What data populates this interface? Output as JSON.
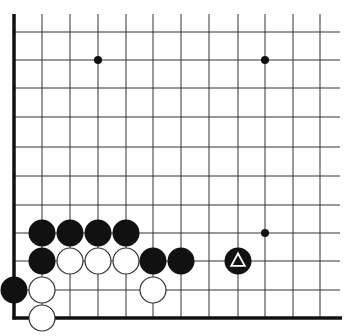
{
  "board": {
    "title": "Go board diagram (lower-left corner)",
    "line_color": "#333333",
    "edge_color": "#111111",
    "background": "#ffffff",
    "columns_x": [
      14,
      42,
      70,
      98,
      126,
      153,
      181,
      209,
      238,
      265,
      293,
      320
    ],
    "rows_y": [
      32,
      60,
      88,
      117,
      147,
      176,
      205,
      233,
      261,
      290,
      318
    ],
    "edges": {
      "left_x": 14,
      "bottom_y": 318,
      "right_extent": 340,
      "top_extent": 14
    }
  },
  "star_points": [
    {
      "x": 98,
      "y": 60
    },
    {
      "x": 265,
      "y": 60
    },
    {
      "x": 265,
      "y": 233
    }
  ],
  "stones": [
    {
      "color": "black",
      "x": 42,
      "y": 233
    },
    {
      "color": "black",
      "x": 70,
      "y": 233
    },
    {
      "color": "black",
      "x": 98,
      "y": 233
    },
    {
      "color": "black",
      "x": 126,
      "y": 233
    },
    {
      "color": "black",
      "x": 42,
      "y": 261
    },
    {
      "color": "black",
      "x": 153,
      "y": 261
    },
    {
      "color": "black",
      "x": 181,
      "y": 261
    },
    {
      "color": "black",
      "x": 14,
      "y": 290
    },
    {
      "color": "black",
      "x": 238,
      "y": 261,
      "mark": "triangle"
    },
    {
      "color": "white",
      "x": 70,
      "y": 261
    },
    {
      "color": "white",
      "x": 98,
      "y": 261
    },
    {
      "color": "white",
      "x": 126,
      "y": 261
    },
    {
      "color": "white",
      "x": 42,
      "y": 290
    },
    {
      "color": "white",
      "x": 153,
      "y": 290
    },
    {
      "color": "white",
      "x": 42,
      "y": 318
    }
  ],
  "stone_radius": 13.5
}
